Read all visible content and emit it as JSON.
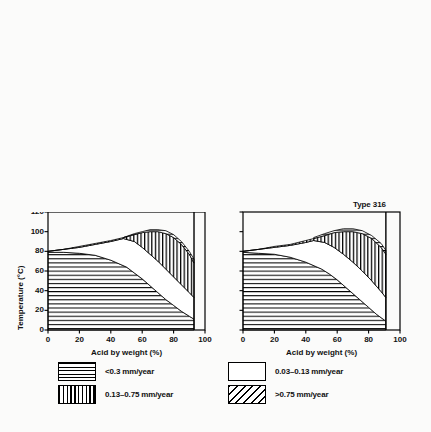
{
  "figure": {
    "shared_xlabel": "Acid by weight (%)",
    "shared_ylabel": "Temperature (°C)",
    "x_ticks": [
      "0",
      "20",
      "40",
      "60",
      "80",
      "100"
    ],
    "y_ticks": [
      "0",
      "20",
      "40",
      "60",
      "80",
      "100",
      "120"
    ]
  },
  "legend": {
    "items": [
      {
        "pattern": "horizontal-lines",
        "label": "<0.3 mm/year"
      },
      {
        "pattern": "blank",
        "label": "0.03–0.13 mm/year"
      },
      {
        "pattern": "vertical-lines",
        "label": "0.13–0.75 mm/year"
      },
      {
        "pattern": "diagonal-hatch",
        "label": ">0.75 mm/year"
      }
    ]
  },
  "chart_data": [
    {
      "id": "phosphoric-304",
      "type": "area",
      "title": "Phosphoric acid",
      "type_label": "Type 304",
      "xlabel": "Acid by weight (%)",
      "ylabel": "Temperature (°C)",
      "xlim": [
        0,
        100
      ],
      "ylim": [
        0,
        120
      ],
      "xticks": [
        0,
        20,
        40,
        60,
        80,
        100
      ],
      "yticks": [
        0,
        20,
        40,
        60,
        80,
        100,
        120
      ],
      "grid": false,
      "data_x_max": 90,
      "boundaries": [
        {
          "name": "top of <0.3 mm/year region",
          "points": [
            [
              0,
              80
            ],
            [
              10,
              80
            ],
            [
              20,
              80
            ],
            [
              30,
              80
            ],
            [
              40,
              80
            ],
            [
              45,
              78
            ],
            [
              50,
              74
            ],
            [
              55,
              70
            ],
            [
              60,
              67
            ],
            [
              65,
              64
            ],
            [
              70,
              61
            ],
            [
              75,
              58
            ],
            [
              80,
              55
            ],
            [
              85,
              51
            ],
            [
              90,
              47
            ]
          ]
        },
        {
          "name": "top of 0.03-0.13 mm/year band",
          "points": [
            [
              0,
              81
            ],
            [
              10,
              81
            ],
            [
              20,
              81.5
            ],
            [
              30,
              82
            ],
            [
              40,
              83
            ],
            [
              45,
              84
            ],
            [
              50,
              82
            ],
            [
              55,
              79
            ],
            [
              60,
              76
            ],
            [
              65,
              73
            ],
            [
              70,
              70
            ],
            [
              75,
              67
            ],
            [
              80,
              64
            ],
            [
              85,
              61
            ],
            [
              90,
              58
            ]
          ]
        },
        {
          "name": "top of 0.13-0.75 mm/year band",
          "points": [
            [
              0,
              81
            ],
            [
              10,
              81
            ],
            [
              20,
              82
            ],
            [
              30,
              83
            ],
            [
              40,
              85
            ],
            [
              45,
              88
            ],
            [
              50,
              92
            ],
            [
              55,
              96
            ],
            [
              60,
              100
            ],
            [
              65,
              104
            ],
            [
              70,
              108
            ],
            [
              75,
              112
            ],
            [
              80,
              116
            ],
            [
              85,
              119
            ],
            [
              90,
              120
            ]
          ]
        }
      ],
      "regions": [
        {
          "class": "<0.3 mm/year",
          "pattern": "horizontal-lines"
        },
        {
          "class": "0.03-0.13 mm/year",
          "pattern": "blank"
        },
        {
          "class": "0.13-0.75 mm/year",
          "pattern": "vertical-lines"
        },
        {
          "class": ">0.75 mm/year",
          "pattern": "diagonal-hatch"
        }
      ]
    },
    {
      "id": "phosphoric-316",
      "type": "area",
      "title": "",
      "type_label": "Type 316",
      "xlabel": "Acid by weight (%)",
      "ylabel": "Temperature (°C)",
      "xlim": [
        0,
        100
      ],
      "ylim": [
        0,
        120
      ],
      "xticks": [
        0,
        20,
        40,
        60,
        80,
        100
      ],
      "yticks": [
        0,
        20,
        40,
        60,
        80,
        100,
        120
      ],
      "grid": false,
      "data_x_max": 88,
      "boundaries": [
        {
          "name": "top of <0.3 mm/year region",
          "points": [
            [
              0,
              80
            ],
            [
              10,
              80
            ],
            [
              20,
              80
            ],
            [
              30,
              80
            ],
            [
              35,
              79
            ],
            [
              40,
              76
            ],
            [
              45,
              72
            ],
            [
              50,
              68
            ],
            [
              55,
              64
            ],
            [
              60,
              60
            ],
            [
              65,
              55
            ],
            [
              70,
              50
            ],
            [
              75,
              45
            ],
            [
              80,
              40
            ],
            [
              85,
              35
            ],
            [
              88,
              32
            ]
          ]
        },
        {
          "name": "top of 0.03-0.13 mm/year band",
          "points": [
            [
              0,
              81
            ],
            [
              10,
              81
            ],
            [
              20,
              81
            ],
            [
              30,
              81.5
            ],
            [
              35,
              82
            ],
            [
              40,
              81
            ],
            [
              45,
              78
            ],
            [
              50,
              75
            ],
            [
              55,
              72
            ],
            [
              60,
              68
            ],
            [
              65,
              64
            ],
            [
              70,
              60
            ],
            [
              75,
              56
            ],
            [
              80,
              52
            ],
            [
              85,
              48
            ],
            [
              88,
              45
            ]
          ]
        },
        {
          "name": "top of 0.13-0.75 mm/year band",
          "points": [
            [
              0,
              81
            ],
            [
              10,
              81
            ],
            [
              20,
              81.5
            ],
            [
              30,
              82
            ],
            [
              35,
              83
            ],
            [
              40,
              85
            ],
            [
              45,
              88
            ],
            [
              50,
              92
            ],
            [
              55,
              96
            ],
            [
              60,
              100
            ],
            [
              65,
              104
            ],
            [
              70,
              108
            ],
            [
              75,
              112
            ],
            [
              80,
              116
            ],
            [
              85,
              119
            ],
            [
              88,
              120
            ]
          ]
        }
      ],
      "regions": [
        {
          "class": "<0.3 mm/year",
          "pattern": "horizontal-lines"
        },
        {
          "class": "0.03-0.13 mm/year",
          "pattern": "blank"
        },
        {
          "class": "0.13-0.75 mm/year",
          "pattern": "vertical-lines"
        },
        {
          "class": ">0.75 mm/year",
          "pattern": "diagonal-hatch"
        }
      ]
    },
    {
      "id": "nitric-304",
      "type": "area",
      "title": "Nitric Acid",
      "type_label": "Type 304",
      "xlabel": "Acid by weight (%)",
      "ylabel": "Temperature (°C)",
      "xlim": [
        0,
        100
      ],
      "ylim": [
        0,
        120
      ],
      "xticks": [
        0,
        20,
        40,
        60,
        80,
        100
      ],
      "yticks": [
        0,
        20,
        40,
        60,
        80,
        100,
        120
      ],
      "grid": false,
      "data_x_max": 93,
      "boundaries": [
        {
          "name": "top of <0.3 mm/year region",
          "points": [
            [
              0,
              79
            ],
            [
              10,
              79
            ],
            [
              20,
              78
            ],
            [
              30,
              76
            ],
            [
              40,
              71
            ],
            [
              50,
              64
            ],
            [
              55,
              58
            ],
            [
              60,
              52
            ],
            [
              65,
              45
            ],
            [
              70,
              38
            ],
            [
              75,
              31
            ],
            [
              80,
              25
            ],
            [
              85,
              19
            ],
            [
              90,
              14
            ],
            [
              93,
              11
            ]
          ]
        },
        {
          "name": "top of 0.03-0.13 mm/year band",
          "points": [
            [
              0,
              80
            ],
            [
              10,
              82
            ],
            [
              20,
              84
            ],
            [
              30,
              87
            ],
            [
              40,
              90
            ],
            [
              48,
              93
            ],
            [
              55,
              90
            ],
            [
              60,
              84
            ],
            [
              65,
              77
            ],
            [
              70,
              70
            ],
            [
              75,
              62
            ],
            [
              80,
              54
            ],
            [
              85,
              46
            ],
            [
              90,
              38
            ],
            [
              93,
              33
            ]
          ]
        },
        {
          "name": "top of 0.13-0.75 mm/year band",
          "points": [
            [
              0,
              80
            ],
            [
              10,
              82
            ],
            [
              20,
              85
            ],
            [
              30,
              88
            ],
            [
              40,
              91
            ],
            [
              48,
              94
            ],
            [
              55,
              97
            ],
            [
              60,
              99
            ],
            [
              65,
              100
            ],
            [
              70,
              100
            ],
            [
              75,
              98
            ],
            [
              80,
              94
            ],
            [
              85,
              87
            ],
            [
              90,
              77
            ],
            [
              93,
              68
            ]
          ]
        },
        {
          "name": "top of >0.75 mm/year region",
          "points": [
            [
              48,
              94
            ],
            [
              55,
              98
            ],
            [
              60,
              100
            ],
            [
              65,
              102
            ],
            [
              70,
              102
            ],
            [
              75,
              101
            ],
            [
              80,
              97
            ],
            [
              85,
              90
            ],
            [
              90,
              80
            ],
            [
              93,
              72
            ]
          ]
        }
      ],
      "regions": [
        {
          "class": "<0.3 mm/year",
          "pattern": "horizontal-lines"
        },
        {
          "class": "0.03-0.13 mm/year",
          "pattern": "blank"
        },
        {
          "class": "0.13-0.75 mm/year",
          "pattern": "vertical-lines"
        },
        {
          "class": ">0.75 mm/year",
          "pattern": "horizontal-lines"
        }
      ]
    },
    {
      "id": "nitric-316",
      "type": "area",
      "title": "",
      "type_label": "Type 316",
      "xlabel": "Acid by weight (%)",
      "ylabel": "Temperature (°C)",
      "xlim": [
        0,
        100
      ],
      "ylim": [
        0,
        120
      ],
      "xticks": [
        0,
        20,
        40,
        60,
        80,
        100
      ],
      "yticks": [
        0,
        20,
        40,
        60,
        80,
        100,
        120
      ],
      "grid": false,
      "data_x_max": 91,
      "boundaries": [
        {
          "name": "top of <0.3 mm/year region",
          "points": [
            [
              0,
              79
            ],
            [
              10,
              78
            ],
            [
              20,
              77
            ],
            [
              30,
              74
            ],
            [
              40,
              69
            ],
            [
              50,
              62
            ],
            [
              55,
              57
            ],
            [
              60,
              51
            ],
            [
              65,
              44
            ],
            [
              70,
              37
            ],
            [
              75,
              30
            ],
            [
              80,
              23
            ],
            [
              85,
              16
            ],
            [
              91,
              9
            ]
          ]
        },
        {
          "name": "top of 0.03-0.13 mm/year band",
          "points": [
            [
              0,
              80
            ],
            [
              10,
              82
            ],
            [
              20,
              84
            ],
            [
              30,
              86
            ],
            [
              40,
              89
            ],
            [
              45,
              91
            ],
            [
              52,
              89
            ],
            [
              58,
              84
            ],
            [
              64,
              77
            ],
            [
              70,
              69
            ],
            [
              76,
              60
            ],
            [
              82,
              50
            ],
            [
              88,
              39
            ],
            [
              91,
              33
            ]
          ]
        },
        {
          "name": "top of 0.13-0.75 mm/year band",
          "points": [
            [
              0,
              80
            ],
            [
              10,
              82
            ],
            [
              20,
              85
            ],
            [
              30,
              87
            ],
            [
              40,
              91
            ],
            [
              45,
              93
            ],
            [
              52,
              96
            ],
            [
              58,
              99
            ],
            [
              64,
              100
            ],
            [
              70,
              100
            ],
            [
              76,
              98
            ],
            [
              82,
              93
            ],
            [
              88,
              84
            ],
            [
              91,
              77
            ]
          ]
        },
        {
          "name": "top of >0.75 mm/year region",
          "points": [
            [
              45,
              94
            ],
            [
              52,
              98
            ],
            [
              58,
              101
            ],
            [
              64,
              103
            ],
            [
              70,
              103
            ],
            [
              76,
              101
            ],
            [
              82,
              96
            ],
            [
              88,
              88
            ],
            [
              91,
              81
            ]
          ]
        }
      ],
      "regions": [
        {
          "class": "<0.3 mm/year",
          "pattern": "horizontal-lines"
        },
        {
          "class": "0.03-0.13 mm/year",
          "pattern": "blank"
        },
        {
          "class": "0.13-0.75 mm/year",
          "pattern": "vertical-lines"
        },
        {
          "class": ">0.75 mm/year",
          "pattern": "horizontal-lines"
        }
      ]
    }
  ]
}
